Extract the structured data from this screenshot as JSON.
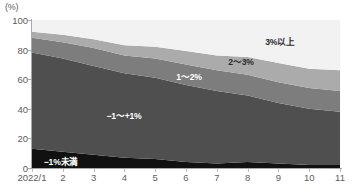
{
  "chart_data": {
    "type": "area",
    "stacked": true,
    "title": "",
    "subtitle": "",
    "xlabel": "",
    "ylabel": "(%)",
    "ylim": [
      0,
      100
    ],
    "yticks": [
      0,
      20,
      40,
      60,
      80,
      100
    ],
    "grid": false,
    "legend_position": "inline-annotations",
    "x": [
      "2022/1",
      "2",
      "3",
      "4",
      "5",
      "6",
      "7",
      "8",
      "9",
      "10",
      "11"
    ],
    "categories": [
      "2022/1",
      "2",
      "3",
      "4",
      "5",
      "6",
      "7",
      "8",
      "9",
      "10",
      "11"
    ],
    "series": [
      {
        "name": "−1%未満",
        "color": "#111111",
        "label_color": "#ffffff",
        "values": [
          13,
          11,
          9,
          7,
          6,
          4,
          3,
          4,
          3,
          2,
          2
        ]
      },
      {
        "name": "−1～+1%",
        "color": "#4f4f4f",
        "label_color": "#ffffff",
        "values": [
          65,
          63,
          60,
          57,
          55,
          52,
          49,
          45,
          41,
          38,
          36
        ]
      },
      {
        "name": "1～2%",
        "color": "#7d7d7d",
        "label_color": "#ffffff",
        "values": [
          10,
          11,
          12,
          12,
          13,
          14,
          14,
          14,
          14,
          14,
          14
        ]
      },
      {
        "name": "2～3%",
        "color": "#ababab",
        "label_color": "#2b2b2b",
        "values": [
          4,
          5,
          6,
          7,
          8,
          9,
          10,
          12,
          13,
          13,
          14
        ]
      },
      {
        "name": "3%以上",
        "color": "#f2f2f2",
        "label_color": "#2b2b2b",
        "values": [
          8,
          10,
          13,
          17,
          18,
          21,
          24,
          25,
          29,
          33,
          34
        ]
      }
    ],
    "annotations": [
      {
        "text": "3%以上",
        "x_px": 280,
        "y_px": 41,
        "color": "#2b2b2b"
      },
      {
        "text": "2～3%",
        "x_px": 241,
        "y_px": 61,
        "color": "#2b2b2b"
      },
      {
        "text": "1～2%",
        "x_px": 189,
        "y_px": 76,
        "color": "#ffffff"
      },
      {
        "text": "−1～+1%",
        "x_px": 124,
        "y_px": 115,
        "color": "#ffffff"
      },
      {
        "text": "−1%未満",
        "x_px": 61,
        "y_px": 161,
        "color": "#ffffff"
      }
    ]
  }
}
